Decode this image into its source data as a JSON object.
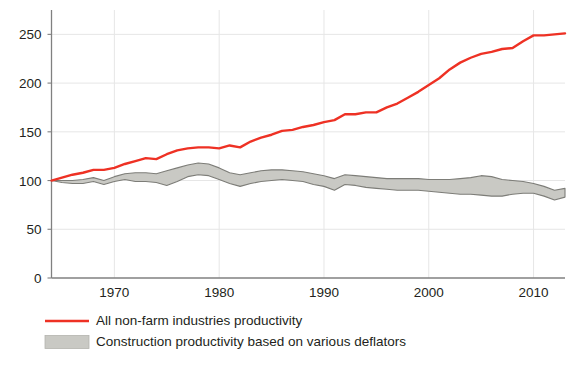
{
  "chart_data": {
    "type": "line",
    "title": "",
    "subtitle": "",
    "xlabel": "",
    "ylabel": "",
    "xlim": [
      1964,
      2013
    ],
    "ylim": [
      0,
      275
    ],
    "grid": true,
    "legend_position": "bottom-left",
    "y_ticks": [
      0,
      50,
      100,
      150,
      200,
      250
    ],
    "y_tick_labels": [
      "0",
      "50",
      "100",
      "150",
      "200",
      "250"
    ],
    "x_ticks": [
      1970,
      1980,
      1990,
      2000,
      2010
    ],
    "x_tick_labels": [
      "1970",
      "1980",
      "1990",
      "2000",
      "2010"
    ],
    "colors": {
      "line": "#ee3124",
      "band_fill": "#c9c9c4",
      "band_stroke": "#7d7d78",
      "axis": "#808080",
      "grid": "#e6e6e6",
      "text": "#231f20"
    },
    "series": [
      {
        "name": "All non-farm industries productivity",
        "kind": "line",
        "color": "#ee3124",
        "x": [
          1964,
          1965,
          1966,
          1967,
          1968,
          1969,
          1970,
          1971,
          1972,
          1973,
          1974,
          1975,
          1976,
          1977,
          1978,
          1979,
          1980,
          1981,
          1982,
          1983,
          1984,
          1985,
          1986,
          1987,
          1988,
          1989,
          1990,
          1991,
          1992,
          1993,
          1994,
          1995,
          1996,
          1997,
          1998,
          1999,
          2000,
          2001,
          2002,
          2003,
          2004,
          2005,
          2006,
          2007,
          2008,
          2009,
          2010,
          2011,
          2012,
          2013
        ],
        "values": [
          100,
          103,
          106,
          108,
          111,
          111,
          113,
          117,
          120,
          123,
          122,
          127,
          131,
          133,
          134,
          134,
          133,
          136,
          134,
          140,
          144,
          147,
          151,
          152,
          155,
          157,
          160,
          162,
          168,
          168,
          170,
          170,
          175,
          179,
          185,
          191,
          198,
          205,
          214,
          221,
          226,
          230,
          232,
          235,
          236,
          243,
          249,
          249,
          250,
          251
        ],
        "stroke_width": 2.4
      },
      {
        "name": "Construction productivity based on various deflators",
        "kind": "band",
        "fill": "#c9c9c4",
        "stroke": "#7d7d78",
        "x": [
          1964,
          1965,
          1966,
          1967,
          1968,
          1969,
          1970,
          1971,
          1972,
          1973,
          1974,
          1975,
          1976,
          1977,
          1978,
          1979,
          1980,
          1981,
          1982,
          1983,
          1984,
          1985,
          1986,
          1987,
          1988,
          1989,
          1990,
          1991,
          1992,
          1993,
          1994,
          1995,
          1996,
          1997,
          1998,
          1999,
          2000,
          2001,
          2002,
          2003,
          2004,
          2005,
          2006,
          2007,
          2008,
          2009,
          2010,
          2011,
          2012,
          2013
        ],
        "upper": [
          100,
          100,
          100,
          101,
          103,
          100,
          104,
          107,
          108,
          108,
          107,
          110,
          113,
          116,
          118,
          117,
          113,
          108,
          106,
          108,
          110,
          111,
          111,
          110,
          109,
          107,
          105,
          102,
          106,
          105,
          104,
          103,
          102,
          102,
          102,
          102,
          101,
          101,
          101,
          102,
          103,
          105,
          104,
          101,
          100,
          99,
          97,
          94,
          90,
          92
        ],
        "lower": [
          100,
          98,
          97,
          97,
          99,
          96,
          99,
          101,
          99,
          99,
          98,
          95,
          99,
          104,
          106,
          105,
          101,
          97,
          94,
          97,
          99,
          100,
          101,
          100,
          99,
          96,
          94,
          90,
          96,
          95,
          93,
          92,
          91,
          90,
          90,
          90,
          89,
          88,
          87,
          86,
          86,
          85,
          84,
          84,
          86,
          87,
          87,
          84,
          80,
          83
        ]
      }
    ]
  },
  "legend": {
    "items": [
      {
        "label": "All non-farm industries productivity",
        "marker": "line",
        "color": "#ee3124"
      },
      {
        "label": "Construction productivity based on various deflators",
        "marker": "swatch",
        "color": "#c9c9c4"
      }
    ]
  }
}
